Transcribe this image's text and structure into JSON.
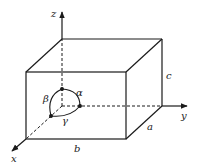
{
  "diagram": {
    "type": "unit-cell",
    "axes": {
      "x": "x",
      "y": "y",
      "z": "z"
    },
    "edges": {
      "a": "a",
      "b": "b",
      "c": "c"
    },
    "angles": {
      "alpha": "α",
      "beta": "β",
      "gamma": "γ"
    },
    "colors": {
      "line": "#1a1a1a",
      "background": "#ffffff"
    }
  }
}
